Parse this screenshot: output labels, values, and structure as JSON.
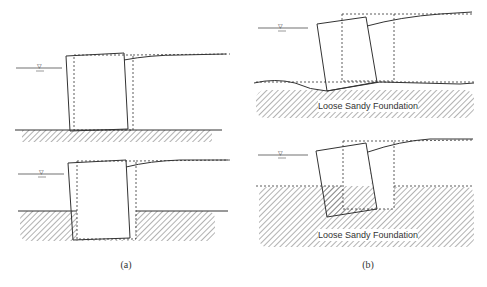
{
  "figure": {
    "panels": [
      {
        "id": "a",
        "caption": "(a)",
        "description": "Caisson on firm foundation: sliding/tilting (top) and embedded caisson tilting (bottom)"
      },
      {
        "id": "b",
        "caption": "(b)",
        "description": "Caisson on loose sandy foundation: settlement and tilting"
      }
    ],
    "labels": {
      "foundation_top": "Loose Sandy Foundation",
      "foundation_bottom": "Loose Sandy Foundation",
      "water_level_symbol": "▽"
    },
    "legend": {
      "solid_line": "deformed position",
      "dashed_line": "original position"
    },
    "colors": {
      "line": "#333333",
      "hatch": "#555555",
      "background": "#ffffff"
    }
  }
}
